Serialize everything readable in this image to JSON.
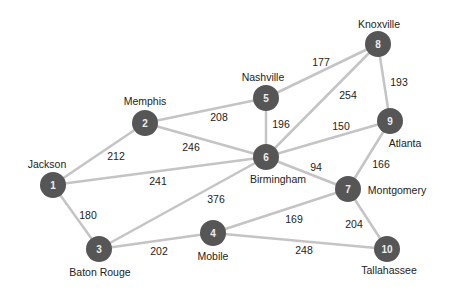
{
  "nodes": [
    {
      "id": "1",
      "name": "Jackson",
      "x": 53,
      "y": 185,
      "lx": 47,
      "ly": 164
    },
    {
      "id": "2",
      "name": "Memphis",
      "x": 145,
      "y": 123,
      "lx": 145,
      "ly": 101
    },
    {
      "id": "3",
      "name": "Baton Rouge",
      "x": 99,
      "y": 249,
      "lx": 100,
      "ly": 272
    },
    {
      "id": "4",
      "name": "Mobile",
      "x": 213,
      "y": 233,
      "lx": 213,
      "ly": 256
    },
    {
      "id": "5",
      "name": "Nashville",
      "x": 266,
      "y": 98,
      "lx": 263,
      "ly": 77
    },
    {
      "id": "6",
      "name": "Birmingham",
      "x": 266,
      "y": 157,
      "lx": 278,
      "ly": 179
    },
    {
      "id": "7",
      "name": "Montgomery",
      "x": 348,
      "y": 189,
      "lx": 397,
      "ly": 190
    },
    {
      "id": "8",
      "name": "Knoxville",
      "x": 378,
      "y": 44,
      "lx": 379,
      "ly": 24
    },
    {
      "id": "9",
      "name": "Atlanta",
      "x": 390,
      "y": 121,
      "lx": 405,
      "ly": 143
    },
    {
      "id": "10",
      "name": "Tallahassee",
      "x": 387,
      "y": 249,
      "lx": 389,
      "ly": 270
    }
  ],
  "edges": [
    {
      "a": 0,
      "b": 1,
      "w": "212",
      "lx": 116,
      "ly": 156
    },
    {
      "a": 0,
      "b": 5,
      "w": "241",
      "lx": 158,
      "ly": 181
    },
    {
      "a": 0,
      "b": 2,
      "w": "180",
      "lx": 88,
      "ly": 215
    },
    {
      "a": 1,
      "b": 4,
      "w": "208",
      "lx": 219,
      "ly": 117
    },
    {
      "a": 1,
      "b": 5,
      "w": "246",
      "lx": 191,
      "ly": 147
    },
    {
      "a": 2,
      "b": 5,
      "w": "376",
      "lx": 216,
      "ly": 199
    },
    {
      "a": 2,
      "b": 3,
      "w": "202",
      "lx": 159,
      "ly": 251
    },
    {
      "a": 3,
      "b": 6,
      "w": "169",
      "lx": 294,
      "ly": 219
    },
    {
      "a": 3,
      "b": 9,
      "w": "248",
      "lx": 304,
      "ly": 250
    },
    {
      "a": 4,
      "b": 5,
      "w": "196",
      "lx": 281,
      "ly": 124
    },
    {
      "a": 4,
      "b": 7,
      "w": "177",
      "lx": 321,
      "ly": 62
    },
    {
      "a": 5,
      "b": 7,
      "w": "254",
      "lx": 348,
      "ly": 95
    },
    {
      "a": 5,
      "b": 8,
      "w": "150",
      "lx": 341,
      "ly": 126
    },
    {
      "a": 5,
      "b": 6,
      "w": "94",
      "lx": 316,
      "ly": 167
    },
    {
      "a": 7,
      "b": 8,
      "w": "193",
      "lx": 399,
      "ly": 82
    },
    {
      "a": 6,
      "b": 8,
      "w": "166",
      "lx": 381,
      "ly": 164
    },
    {
      "a": 6,
      "b": 9,
      "w": "204",
      "lx": 354,
      "ly": 224
    }
  ],
  "colors": {
    "edge": "#c4c4c4",
    "node": "#565656"
  }
}
